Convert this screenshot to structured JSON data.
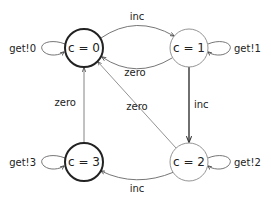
{
  "diagram": {
    "type": "state-machine",
    "nodes": [
      {
        "id": "s0",
        "label": "c = 0",
        "thick": true
      },
      {
        "id": "s1",
        "label": "c = 1",
        "thick": false
      },
      {
        "id": "s2",
        "label": "c = 2",
        "thick": false
      },
      {
        "id": "s3",
        "label": "c = 3",
        "thick": true
      }
    ],
    "edges": [
      {
        "from": "s0",
        "to": "s1",
        "label": "inc"
      },
      {
        "from": "s1",
        "to": "s0",
        "label": "zero"
      },
      {
        "from": "s1",
        "to": "s2",
        "label": "inc"
      },
      {
        "from": "s2",
        "to": "s0",
        "label": "zero"
      },
      {
        "from": "s2",
        "to": "s3",
        "label": "inc"
      },
      {
        "from": "s3",
        "to": "s0",
        "label": "zero"
      },
      {
        "from": "s0",
        "to": "s0",
        "label": "get!0"
      },
      {
        "from": "s1",
        "to": "s1",
        "label": "get!1"
      },
      {
        "from": "s2",
        "to": "s2",
        "label": "get!2"
      },
      {
        "from": "s3",
        "to": "s3",
        "label": "get!3"
      }
    ]
  }
}
